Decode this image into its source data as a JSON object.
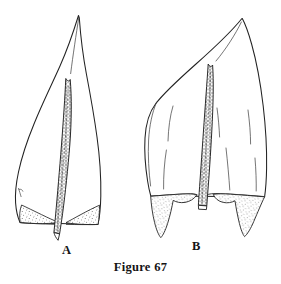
{
  "figure": {
    "caption": "Figure 67",
    "background_color": "#ffffff",
    "ink_color": "#1a1a1a",
    "width": 281,
    "height": 284,
    "medium": "ink line drawing"
  },
  "specimens": [
    {
      "id": "A",
      "label": "A",
      "description": "narrowly lanceolate leaf with long slender acumen",
      "shape": "lanceolate-acuminate",
      "apex": "long acuminate",
      "base": "auriculate, truncate",
      "costa": "single, percurrent, excurrent at base, cellular",
      "auricles": "small, stippled, triangular",
      "margin": "entire",
      "lamina_folds": 1
    },
    {
      "id": "B",
      "label": "B",
      "description": "broadly ovate leaf with short acumen and large decurrent auricles",
      "shape": "ovate-acuminate",
      "apex": "short acuminate",
      "base": "strongly auriculate, decurrent",
      "costa": "single, percurrent, excurrent at base, cellular",
      "auricles": "large, stippled, triangular-decurrent",
      "margin": "entire",
      "lamina_folds": 5
    }
  ],
  "icons": {
    "stipple": "stipple-texture",
    "costa_cells": "cell-texture"
  }
}
